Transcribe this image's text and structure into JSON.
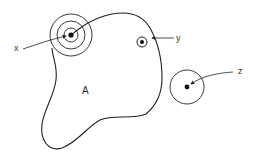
{
  "diagram": {
    "type": "set-membership-illustration",
    "region": {
      "label": "A",
      "shape": "irregular closed curve"
    },
    "points": [
      {
        "label": "x",
        "description": "point on boundary of A, surrounded by three concentric circles",
        "center": [
          71,
          35
        ],
        "rings": [
          7,
          14,
          21
        ]
      },
      {
        "label": "y",
        "description": "point inside A with small circle, near boundary",
        "center": [
          142,
          42
        ],
        "rings": [
          5
        ]
      },
      {
        "label": "z",
        "description": "point outside A with a circle not intersecting A",
        "center": [
          187,
          87
        ],
        "rings": [
          17
        ]
      }
    ],
    "labels": {
      "x": "x",
      "y": "y",
      "z": "z",
      "a": "A"
    },
    "colors": {
      "stroke": "#222222",
      "background": "#ffffff",
      "text": "#333333"
    }
  }
}
